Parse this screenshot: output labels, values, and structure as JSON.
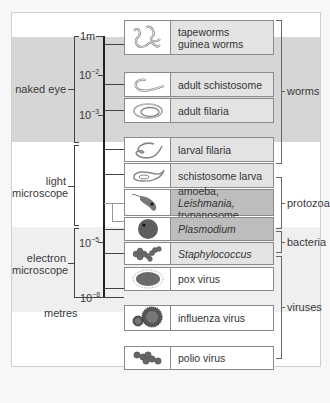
{
  "figure": {
    "scale_unit": "metres",
    "scale_ticks": [
      {
        "label": "1m",
        "exp": ""
      },
      {
        "label": "10",
        "exp": "−2"
      },
      {
        "label": "10",
        "exp": "−3"
      },
      {
        "label": "10",
        "exp": "−5"
      },
      {
        "label": "10",
        "exp": "−8"
      }
    ],
    "ranges": [
      {
        "label": "naked eye"
      },
      {
        "label_line1": "light",
        "label_line2": "microscope"
      },
      {
        "label_line1": "electron",
        "label_line2": "microscope"
      }
    ],
    "organisms": [
      {
        "icon": "tapeworm-icon",
        "line1": "tapeworms",
        "line2": "guinea worms",
        "shade": "#e3e3e3"
      },
      {
        "icon": "adult-schistosome-icon",
        "line1": "adult schistosome",
        "shade": "#e3e3e3"
      },
      {
        "icon": "adult-filaria-icon",
        "line1": "adult filaria",
        "shade": "#e3e3e3"
      },
      {
        "icon": "larval-filaria-icon",
        "line1": "larval filaria",
        "shade": "#e3e3e3"
      },
      {
        "icon": "schistosome-larva-icon",
        "line1": "schistosome larva",
        "shade": "#e3e3e3"
      },
      {
        "icon": "trypanosome-icon",
        "line1_a": "amoeba, ",
        "line1_b": "Leishmania,",
        "line2": "trypanosome",
        "shade": "#bdbdbd"
      },
      {
        "icon": "plasmodium-icon",
        "line1": "Plasmodium",
        "shade": "#bdbdbd"
      },
      {
        "icon": "staphylococcus-icon",
        "line1": "Staphylococcus",
        "shade": "#e3e3e3"
      },
      {
        "icon": "pox-virus-icon",
        "line1": "pox virus",
        "shade": "#ffffff"
      },
      {
        "icon": "influenza-virus-icon",
        "line1": "influenza virus",
        "shade": "#ffffff"
      },
      {
        "icon": "polio-virus-icon",
        "line1": "polio virus",
        "shade": "#ffffff"
      }
    ],
    "groups": [
      {
        "label": "worms"
      },
      {
        "label": "protozoa"
      },
      {
        "label": "bacteria"
      },
      {
        "label": "viruses"
      }
    ],
    "colors": {
      "naked_eye_band": "#d6d6d6",
      "light_band": "#ffffff",
      "electron_band": "#eeeeee",
      "icon_fill": "#6a6a6a"
    }
  }
}
